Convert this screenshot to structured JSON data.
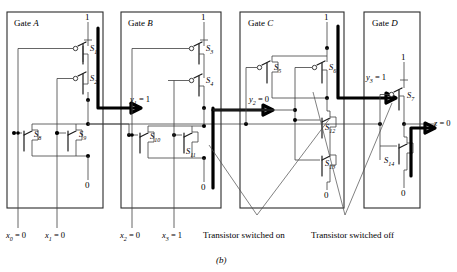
{
  "figure": {
    "caption": "(b)",
    "type": "cmos-transistor-level-circuit"
  },
  "gates": [
    {
      "id": "gate-a",
      "label_prefix": "Gate ",
      "label_letter": "A",
      "vdd": "1",
      "gnd": "0",
      "pmos": [
        "S1",
        "S2"
      ],
      "nmos": [
        "S8",
        "S9"
      ],
      "switch_labels": [
        {
          "name": "S1",
          "base": "S",
          "sub": "1"
        },
        {
          "name": "S2",
          "base": "S",
          "sub": "2"
        },
        {
          "name": "S8",
          "base": "S",
          "sub": "8"
        },
        {
          "name": "S9",
          "base": "S",
          "sub": "9"
        }
      ]
    },
    {
      "id": "gate-b",
      "label_prefix": "Gate ",
      "label_letter": "B",
      "vdd": "1",
      "gnd": "0",
      "pmos": [
        "S3",
        "S4"
      ],
      "nmos": [
        "S10",
        "S11"
      ],
      "switch_labels": [
        {
          "name": "S3",
          "base": "S",
          "sub": "3"
        },
        {
          "name": "S4",
          "base": "S",
          "sub": "4"
        },
        {
          "name": "S10",
          "base": "S",
          "sub": "10"
        },
        {
          "name": "S11",
          "base": "S",
          "sub": "11"
        }
      ]
    },
    {
      "id": "gate-c",
      "label_prefix": "Gate ",
      "label_letter": "C",
      "vdd": "1",
      "gnd": "0",
      "pmos": [
        "S5",
        "S6"
      ],
      "nmos": [
        "S12",
        "S13"
      ],
      "switch_labels": [
        {
          "name": "S5",
          "base": "S",
          "sub": "5"
        },
        {
          "name": "S6",
          "base": "S",
          "sub": "6"
        },
        {
          "name": "S12",
          "base": "S",
          "sub": "12"
        },
        {
          "name": "S13",
          "base": "S",
          "sub": "13"
        }
      ]
    },
    {
      "id": "gate-d",
      "label_prefix": "Gate ",
      "label_letter": "D",
      "vdd": "1",
      "gnd": "0",
      "pmos": [
        "S7"
      ],
      "nmos": [
        "S14"
      ],
      "switch_labels": [
        {
          "name": "S7",
          "base": "S",
          "sub": "7"
        },
        {
          "name": "S14",
          "base": "S",
          "sub": "14"
        }
      ]
    }
  ],
  "signals": {
    "inputs": [
      {
        "name": "x0",
        "base": "x",
        "sub": "0",
        "eq": " = ",
        "value": "0"
      },
      {
        "name": "x1",
        "base": "x",
        "sub": "1",
        "eq": " = ",
        "value": "0"
      },
      {
        "name": "x2",
        "base": "x",
        "sub": "2",
        "eq": " = ",
        "value": "0"
      },
      {
        "name": "x3",
        "base": "x",
        "sub": "3",
        "eq": " = ",
        "value": "1"
      }
    ],
    "internal": [
      {
        "name": "y1",
        "base": "y",
        "sub": "1",
        "eq": " = ",
        "value": "1"
      },
      {
        "name": "y2",
        "base": "y",
        "sub": "2",
        "eq": " = ",
        "value": "0"
      },
      {
        "name": "y3",
        "base": "y",
        "sub": "3",
        "eq": " = ",
        "value": "1"
      }
    ],
    "output": {
      "name": "z",
      "base": "z",
      "sub": "",
      "eq": " = ",
      "value": "0"
    }
  },
  "annotations": {
    "on": "Transistor switched on",
    "off": "Transistor switched off"
  },
  "rails": {
    "vdd": "1",
    "gnd": "0"
  }
}
